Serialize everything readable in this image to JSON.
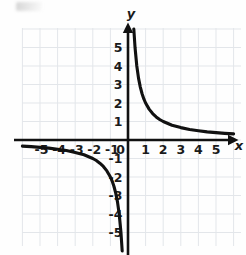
{
  "figure": {
    "kind": "coordinate-plane-graph",
    "x_axis_label": "x",
    "y_axis_label": "y",
    "origin_label": "0"
  },
  "chart_data": {
    "type": "line",
    "title": "",
    "subtitle": "",
    "xlabel": "x",
    "ylabel": "y",
    "xlim": [
      -6.1,
      6.4
    ],
    "ylim": [
      -6.2,
      6.2
    ],
    "grid": true,
    "grid_step": 1,
    "legend": "none",
    "axis_arrows": [
      "x-positive",
      "y-positive"
    ],
    "x_ticks": [
      -5,
      -4,
      -3,
      -2,
      -1,
      0,
      1,
      2,
      3,
      4,
      5
    ],
    "x_ticklabels": [
      "-5",
      "-4",
      "-3",
      "-2",
      "-1",
      "0",
      "1",
      "2",
      "3",
      "4",
      "5"
    ],
    "y_ticks": [
      -5,
      -4,
      -3,
      -2,
      -1,
      1,
      2,
      3,
      4,
      5
    ],
    "y_ticklabels": [
      "-5",
      "-4",
      "-3",
      "-2",
      "-1",
      "1",
      "2",
      "3",
      "4",
      "5"
    ],
    "equation": "y = 2/x",
    "asymptotes": {
      "vertical": 0,
      "horizontal": 0
    },
    "branches": [
      {
        "name": "quadrant-I-branch",
        "x": [
          0.33,
          0.4,
          0.5,
          0.6,
          0.7,
          0.8,
          0.9,
          1.0,
          1.2,
          1.4,
          1.6,
          1.8,
          2.0,
          2.5,
          3.0,
          3.5,
          4.0,
          4.5,
          5.0,
          5.5,
          6.0
        ],
        "y": [
          6.0,
          5.0,
          4.0,
          3.33,
          2.86,
          2.5,
          2.22,
          2.0,
          1.67,
          1.43,
          1.25,
          1.11,
          1.0,
          0.8,
          0.67,
          0.57,
          0.5,
          0.44,
          0.4,
          0.36,
          0.33
        ]
      },
      {
        "name": "quadrant-III-branch",
        "x": [
          -6.0,
          -5.5,
          -5.0,
          -4.5,
          -4.0,
          -3.5,
          -3.0,
          -2.5,
          -2.0,
          -1.8,
          -1.6,
          -1.4,
          -1.2,
          -1.0,
          -0.9,
          -0.8,
          -0.7,
          -0.6,
          -0.5,
          -0.4,
          -0.33
        ],
        "y": [
          -0.33,
          -0.36,
          -0.4,
          -0.44,
          -0.5,
          -0.57,
          -0.67,
          -0.8,
          -1.0,
          -1.11,
          -1.25,
          -1.43,
          -1.67,
          -2.0,
          -2.22,
          -2.5,
          -2.86,
          -3.33,
          -4.0,
          -5.0,
          -6.0
        ]
      }
    ],
    "colors": {
      "curve": "#111111",
      "axis": "#111111",
      "grid": "#e3e6ea",
      "label": "#1a1a1a",
      "background": "#fefefe"
    }
  }
}
